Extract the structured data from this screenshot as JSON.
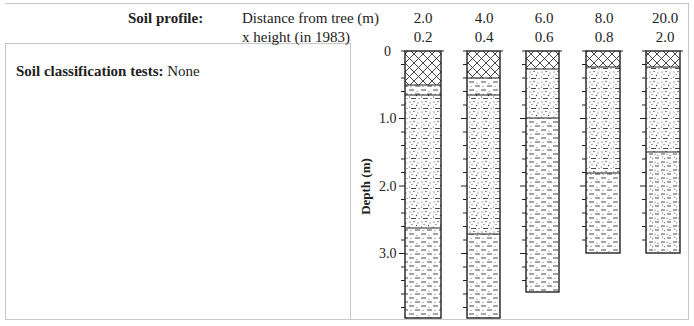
{
  "header": {
    "title": "Soil profile:",
    "row1_label": "Distance from tree (m)",
    "row2_label": "x height (in 1983)",
    "distances": [
      "2.0",
      "4.0",
      "6.0",
      "8.0",
      "20.0"
    ],
    "x_heights": [
      "0.2",
      "0.4",
      "0.6",
      "0.8",
      "2.0"
    ]
  },
  "left_panel": {
    "tests_label": "Soil classification tests:",
    "tests_value": "None"
  },
  "axis": {
    "label": "Depth (m)",
    "ticks": [
      "0",
      "1.0",
      "2.0",
      "3.0"
    ]
  },
  "legend_patterns": {
    "crosshatch": "topsoil (cross-hatched)",
    "dashed": "silt/clay (dashed)",
    "sandy": "sandy silt (dotted + dashed)",
    "silty_sand": "silty sand (dotted + dashed, denser dots)"
  },
  "profiles": [
    {
      "distance": "2.0",
      "x_height": "0.2",
      "bottom_m": 3.95,
      "layers": [
        {
          "from": 0,
          "to": 0.5,
          "pattern": "crosshatch"
        },
        {
          "from": 0.5,
          "to": 0.65,
          "pattern": "dashed"
        },
        {
          "from": 0.65,
          "to": 2.63,
          "pattern": "sandy"
        },
        {
          "from": 2.63,
          "to": 3.95,
          "pattern": "dashed"
        }
      ]
    },
    {
      "distance": "4.0",
      "x_height": "0.4",
      "bottom_m": 3.95,
      "layers": [
        {
          "from": 0,
          "to": 0.4,
          "pattern": "crosshatch"
        },
        {
          "from": 0.4,
          "to": 0.65,
          "pattern": "dashed"
        },
        {
          "from": 0.65,
          "to": 2.72,
          "pattern": "sandy"
        },
        {
          "from": 2.72,
          "to": 3.95,
          "pattern": "dashed"
        }
      ]
    },
    {
      "distance": "6.0",
      "x_height": "0.6",
      "bottom_m": 3.58,
      "layers": [
        {
          "from": 0,
          "to": 0.27,
          "pattern": "crosshatch"
        },
        {
          "from": 0.27,
          "to": 1.0,
          "pattern": "sandy"
        },
        {
          "from": 1.0,
          "to": 3.58,
          "pattern": "dashed"
        }
      ]
    },
    {
      "distance": "8.0",
      "x_height": "0.8",
      "bottom_m": 3.0,
      "layers": [
        {
          "from": 0,
          "to": 0.23,
          "pattern": "crosshatch"
        },
        {
          "from": 0.23,
          "to": 1.8,
          "pattern": "sandy"
        },
        {
          "from": 1.8,
          "to": 3.0,
          "pattern": "dashed"
        }
      ]
    },
    {
      "distance": "20.0",
      "x_height": "2.0",
      "bottom_m": 3.0,
      "layers": [
        {
          "from": 0,
          "to": 0.23,
          "pattern": "crosshatch"
        },
        {
          "from": 0.23,
          "to": 1.5,
          "pattern": "sandy"
        },
        {
          "from": 1.5,
          "to": 3.0,
          "pattern": "silty_sand"
        }
      ]
    }
  ],
  "colors": {
    "frame": "#c8c8c8",
    "ink": "#222222"
  }
}
